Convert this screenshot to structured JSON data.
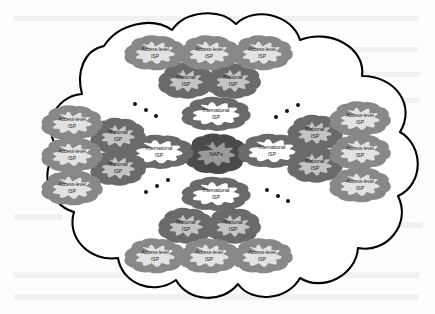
{
  "labels": {
    "naps": "NAPs",
    "international_isp": "International\nISP",
    "international_isp_line1": "International",
    "international_isp_line2": "ISP",
    "national_isp_line1": "National",
    "national_isp_line2": "ISP",
    "access_level_isp_line1": "Access-level",
    "access_level_isp_line2": "ISP"
  },
  "colors": {
    "outer_cloud_stroke": "#000000",
    "outer_cloud_fill": "#ffffff",
    "naps_fill": "#9a9a9a",
    "naps_stroke": "#4a4a4a",
    "national_fill": "#c4c4c4",
    "national_stroke": "#6a6a6a",
    "access_fill": "#e2e2e2",
    "access_stroke": "#888888",
    "international_fill": "#ffffff",
    "international_stroke": "#6a6a6a",
    "text": "#1a1a1a",
    "dot": "#111111",
    "page_background": "#fdfdfd",
    "ghost_text": "#e8e8e8"
  },
  "nodes": [
    {
      "id": "naps",
      "type": "NAPs",
      "label_line1": "NAPs",
      "label_line2": "",
      "cx": 216,
      "cy": 154,
      "rx": 26,
      "ry": 17,
      "tier": 0
    },
    {
      "id": "intl-top",
      "type": "International ISP",
      "label_line1": "International",
      "label_line2": "ISP",
      "cx": 216,
      "cy": 114,
      "rx": 30,
      "ry": 15,
      "tier": 1
    },
    {
      "id": "intl-left",
      "type": "International ISP",
      "label_line1": "International",
      "label_line2": "ISP",
      "cx": 159,
      "cy": 152,
      "rx": 30,
      "ry": 15,
      "tier": 1
    },
    {
      "id": "intl-right",
      "type": "International ISP",
      "label_line1": "International",
      "label_line2": "ISP",
      "cx": 272,
      "cy": 151,
      "rx": 30,
      "ry": 15,
      "tier": 1
    },
    {
      "id": "intl-bottom",
      "type": "International ISP",
      "label_line1": "International",
      "label_line2": "ISP",
      "cx": 216,
      "cy": 194,
      "rx": 30,
      "ry": 15,
      "tier": 1
    },
    {
      "id": "natl-top-left",
      "type": "National ISP",
      "label_line1": "National",
      "label_line2": "ISP",
      "cx": 186,
      "cy": 81,
      "rx": 23,
      "ry": 15,
      "tier": 2
    },
    {
      "id": "natl-top-right",
      "type": "National ISP",
      "label_line1": "National",
      "label_line2": "ISP",
      "cx": 233,
      "cy": 81,
      "rx": 23,
      "ry": 15,
      "tier": 2
    },
    {
      "id": "natl-left-up",
      "type": "National ISP",
      "label_line1": "National",
      "label_line2": "ISP",
      "cx": 118,
      "cy": 136,
      "rx": 23,
      "ry": 15,
      "tier": 2
    },
    {
      "id": "natl-left-dn",
      "type": "National ISP",
      "label_line1": "National",
      "label_line2": "ISP",
      "cx": 118,
      "cy": 168,
      "rx": 23,
      "ry": 15,
      "tier": 2
    },
    {
      "id": "natl-right-up",
      "type": "National ISP",
      "label_line1": "National",
      "label_line2": "ISP",
      "cx": 315,
      "cy": 133,
      "rx": 23,
      "ry": 15,
      "tier": 2
    },
    {
      "id": "natl-right-dn",
      "type": "National ISP",
      "label_line1": "National",
      "label_line2": "ISP",
      "cx": 315,
      "cy": 165,
      "rx": 23,
      "ry": 15,
      "tier": 2
    },
    {
      "id": "natl-bot-left",
      "type": "National ISP",
      "label_line1": "National",
      "label_line2": "ISP",
      "cx": 186,
      "cy": 226,
      "rx": 23,
      "ry": 15,
      "tier": 2
    },
    {
      "id": "natl-bot-right",
      "type": "National ISP",
      "label_line1": "National",
      "label_line2": "ISP",
      "cx": 233,
      "cy": 226,
      "rx": 23,
      "ry": 15,
      "tier": 2
    },
    {
      "id": "acc-top-1",
      "type": "Access-level ISP",
      "label_line1": "Access-level",
      "label_line2": "ISP",
      "cx": 155,
      "cy": 53,
      "rx": 26,
      "ry": 15,
      "tier": 3
    },
    {
      "id": "acc-top-2",
      "type": "Access-level ISP",
      "label_line1": "Access-level",
      "label_line2": "ISP",
      "cx": 209,
      "cy": 53,
      "rx": 26,
      "ry": 15,
      "tier": 3
    },
    {
      "id": "acc-top-3",
      "type": "Access-level ISP",
      "label_line1": "Access-level",
      "label_line2": "ISP",
      "cx": 262,
      "cy": 53,
      "rx": 26,
      "ry": 15,
      "tier": 3
    },
    {
      "id": "acc-left-1",
      "type": "Access-level ISP",
      "label_line1": "Access-level",
      "label_line2": "ISP",
      "cx": 72,
      "cy": 123,
      "rx": 26,
      "ry": 15,
      "tier": 3
    },
    {
      "id": "acc-left-2",
      "type": "Access-level ISP",
      "label_line1": "Access-level",
      "label_line2": "ISP",
      "cx": 72,
      "cy": 155,
      "rx": 26,
      "ry": 15,
      "tier": 3
    },
    {
      "id": "acc-left-3",
      "type": "Access-level ISP",
      "label_line1": "Access-level",
      "label_line2": "ISP",
      "cx": 72,
      "cy": 188,
      "rx": 26,
      "ry": 15,
      "tier": 3
    },
    {
      "id": "acc-right-1",
      "type": "Access-level ISP",
      "label_line1": "Access-level",
      "label_line2": "ISP",
      "cx": 360,
      "cy": 119,
      "rx": 26,
      "ry": 15,
      "tier": 3
    },
    {
      "id": "acc-right-2",
      "type": "Access-level ISP",
      "label_line1": "Access-level",
      "label_line2": "ISP",
      "cx": 360,
      "cy": 152,
      "rx": 26,
      "ry": 15,
      "tier": 3
    },
    {
      "id": "acc-right-3",
      "type": "Access-level ISP",
      "label_line1": "Access-level",
      "label_line2": "ISP",
      "cx": 360,
      "cy": 185,
      "rx": 26,
      "ry": 15,
      "tier": 3
    },
    {
      "id": "acc-bot-1",
      "type": "Access-level ISP",
      "label_line1": "Access-level",
      "label_line2": "ISP",
      "cx": 155,
      "cy": 256,
      "rx": 26,
      "ry": 15,
      "tier": 3
    },
    {
      "id": "acc-bot-2",
      "type": "Access-level ISP",
      "label_line1": "Access-level",
      "label_line2": "ISP",
      "cx": 209,
      "cy": 256,
      "rx": 26,
      "ry": 15,
      "tier": 3
    },
    {
      "id": "acc-bot-3",
      "type": "Access-level ISP",
      "label_line1": "Access-level",
      "label_line2": "ISP",
      "cx": 262,
      "cy": 256,
      "rx": 26,
      "ry": 15,
      "tier": 3
    }
  ],
  "ellipsis_dots": [
    {
      "group": "upper-left",
      "points": [
        {
          "x": 135,
          "y": 104
        },
        {
          "x": 146,
          "y": 110
        },
        {
          "x": 156,
          "y": 116
        }
      ]
    },
    {
      "group": "upper-right",
      "points": [
        {
          "x": 276,
          "y": 117
        },
        {
          "x": 287,
          "y": 111
        },
        {
          "x": 298,
          "y": 105
        }
      ]
    },
    {
      "group": "lower-left",
      "points": [
        {
          "x": 146,
          "y": 192
        },
        {
          "x": 157,
          "y": 186
        },
        {
          "x": 168,
          "y": 180
        }
      ]
    },
    {
      "group": "lower-right",
      "points": [
        {
          "x": 267,
          "y": 190
        },
        {
          "x": 278,
          "y": 196
        },
        {
          "x": 288,
          "y": 201
        }
      ]
    }
  ],
  "counts": {
    "naps": 1,
    "international_isp": 4,
    "national_isp": 8,
    "access_level_isp": 12,
    "ellipsis_groups": 4
  }
}
